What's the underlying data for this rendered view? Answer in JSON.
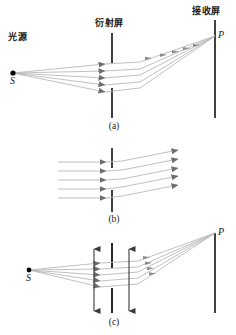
{
  "figure": {
    "width": 236,
    "height": 335,
    "background": "#ffffff"
  },
  "labels": {
    "light_source": "光源",
    "diffraction_screen": "衍射屏",
    "receiving_screen": "接收屏",
    "source_point": "S",
    "image_point": "P",
    "panel_a": "(a)",
    "panel_b": "(b)",
    "panel_c": "(c)"
  },
  "colors": {
    "ray": "#b9b9b9",
    "ray_dark": "#9a9a9a",
    "arrowhead": "#6e6e6e",
    "screen_line": "#111111",
    "point": "#000000",
    "text": "#1a1a1a",
    "background": "#ffffff"
  },
  "geometry": {
    "diffraction_screen_x": 112,
    "receiving_screen_x": 215,
    "panel_a": {
      "source": {
        "x": 13,
        "y": 73
      },
      "point_p": {
        "x": 215,
        "y": 36
      },
      "ray_count": 5,
      "screen_top_segment": [
        33,
        63
      ],
      "screen_bottom_segment": [
        88,
        118
      ]
    },
    "panel_b": {
      "ray_count": 5,
      "ray_entry_x": 58,
      "ray_exit_x": 178,
      "screen_top_segment": [
        148,
        168
      ],
      "screen_bottom_segment": [
        190,
        212
      ]
    },
    "panel_c": {
      "source": {
        "x": 29,
        "y": 270
      },
      "point_p": {
        "x": 215,
        "y": 233
      },
      "ray_count": 5,
      "arrow_left_x": 94,
      "arrow_right_x": 129,
      "arrow_top_y": 243,
      "arrow_bottom_y": 317,
      "screen_top_segment": [
        243,
        268
      ],
      "screen_bottom_segment": [
        288,
        313
      ]
    }
  },
  "panels": [
    {
      "id": "a",
      "label": "(a)",
      "caption": "Point source S emits diverging rays that pass the diffraction screen and converge at P on the receiving screen"
    },
    {
      "id": "b",
      "label": "(b)",
      "caption": "Parallel incident rays bend upward after the diffraction screen"
    },
    {
      "id": "c",
      "label": "(c)",
      "caption": "Same as (a) with double-headed vertical arrows indicating the screen aperture extent"
    }
  ]
}
